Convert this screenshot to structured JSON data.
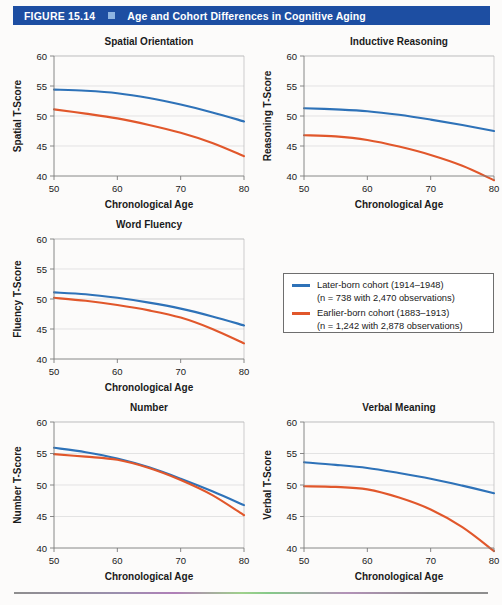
{
  "header": {
    "figure_number": "FIGURE 15.14",
    "separator_icon": "square-marker-icon",
    "title": "Age and Cohort Differences in Cognitive Aging",
    "bar_color": "#1d4ea2",
    "separator_color": "#8db4e2"
  },
  "colors": {
    "later_born": "#2e72b8",
    "earlier_born": "#e1572b",
    "grid": "#d8d8d8",
    "axis": "#7a7a7a"
  },
  "legend": {
    "position": "middle-right",
    "entries": [
      {
        "swatch": "line-swatch-blue",
        "color": "#2e72b8",
        "line1": "Later-born cohort (1914–1948)",
        "line2": "(n = 738 with 2,470 observations)"
      },
      {
        "swatch": "line-swatch-orange",
        "color": "#e1572b",
        "line1": "Earlier-born cohort (1883–1913)",
        "line2": "(n = 1,242 with 2,878 observations)"
      }
    ]
  },
  "chart_data": [
    {
      "id": "spatial-orientation",
      "type": "line",
      "title": "Spatial Orientation",
      "xlabel": "Chronological Age",
      "ylabel": "Spatial T-Score",
      "xlim": [
        50,
        80
      ],
      "ylim": [
        40,
        60
      ],
      "xticks": [
        50,
        60,
        70,
        80
      ],
      "yticks": [
        40,
        45,
        50,
        55,
        60
      ],
      "grid": true,
      "x": [
        50,
        55,
        60,
        65,
        70,
        75,
        80
      ],
      "series": [
        {
          "name": "Later-born cohort (1914–1948)",
          "color": "#2e72b8",
          "values": [
            54.4,
            54.2,
            53.8,
            53.0,
            51.9,
            50.6,
            49.1
          ]
        },
        {
          "name": "Earlier-born cohort (1883–1913)",
          "color": "#e1572b",
          "values": [
            51.1,
            50.4,
            49.6,
            48.5,
            47.2,
            45.5,
            43.3
          ]
        }
      ]
    },
    {
      "id": "inductive-reasoning",
      "type": "line",
      "title": "Inductive Reasoning",
      "xlabel": "Chronological Age",
      "ylabel": "Reasoning T-Score",
      "xlim": [
        50,
        80
      ],
      "ylim": [
        40,
        60
      ],
      "xticks": [
        50,
        60,
        70,
        80
      ],
      "yticks": [
        40,
        45,
        50,
        55,
        60
      ],
      "grid": true,
      "x": [
        50,
        55,
        60,
        65,
        70,
        75,
        80
      ],
      "series": [
        {
          "name": "Later-born cohort (1914–1948)",
          "color": "#2e72b8",
          "values": [
            51.3,
            51.1,
            50.8,
            50.2,
            49.4,
            48.5,
            47.5
          ]
        },
        {
          "name": "Earlier-born cohort (1883–1913)",
          "color": "#e1572b",
          "values": [
            46.8,
            46.6,
            46.0,
            44.9,
            43.5,
            41.7,
            39.3
          ]
        }
      ]
    },
    {
      "id": "word-fluency",
      "type": "line",
      "title": "Word Fluency",
      "xlabel": "Chronological Age",
      "ylabel": "Fluency T-Score",
      "xlim": [
        50,
        80
      ],
      "ylim": [
        40,
        60
      ],
      "xticks": [
        50,
        60,
        70,
        80
      ],
      "yticks": [
        40,
        45,
        50,
        55,
        60
      ],
      "grid": true,
      "x": [
        50,
        55,
        60,
        65,
        70,
        75,
        80
      ],
      "series": [
        {
          "name": "Later-born cohort (1914–1948)",
          "color": "#2e72b8",
          "values": [
            51.1,
            50.8,
            50.2,
            49.4,
            48.4,
            47.1,
            45.6
          ]
        },
        {
          "name": "Earlier-born cohort (1883–1913)",
          "color": "#e1572b",
          "values": [
            50.2,
            49.7,
            49.0,
            48.1,
            46.9,
            45.0,
            42.6
          ]
        }
      ]
    },
    {
      "id": "number",
      "type": "line",
      "title": "Number",
      "xlabel": "Chronological Age",
      "ylabel": "Number T-Score",
      "xlim": [
        50,
        80
      ],
      "ylim": [
        40,
        60
      ],
      "xticks": [
        50,
        60,
        70,
        80
      ],
      "yticks": [
        40,
        45,
        50,
        55,
        60
      ],
      "grid": true,
      "x": [
        50,
        55,
        60,
        65,
        70,
        75,
        80
      ],
      "series": [
        {
          "name": "Later-born cohort (1914–1948)",
          "color": "#2e72b8",
          "values": [
            55.9,
            55.2,
            54.2,
            52.8,
            51.0,
            49.0,
            46.8
          ]
        },
        {
          "name": "Earlier-born cohort (1883–1913)",
          "color": "#e1572b",
          "values": [
            54.9,
            54.5,
            54.0,
            52.7,
            50.8,
            48.4,
            45.2
          ]
        }
      ]
    },
    {
      "id": "verbal-meaning",
      "type": "line",
      "title": "Verbal Meaning",
      "xlabel": "Chronological Age",
      "ylabel": "Verbal T-Score",
      "xlim": [
        50,
        80
      ],
      "ylim": [
        40,
        60
      ],
      "xticks": [
        50,
        60,
        70,
        80
      ],
      "yticks": [
        40,
        45,
        50,
        55,
        60
      ],
      "grid": true,
      "x": [
        50,
        55,
        60,
        65,
        70,
        75,
        80
      ],
      "series": [
        {
          "name": "Later-born cohort (1914–1948)",
          "color": "#2e72b8",
          "values": [
            53.6,
            53.2,
            52.7,
            51.9,
            51.0,
            49.9,
            48.7
          ]
        },
        {
          "name": "Earlier-born cohort (1883–1913)",
          "color": "#e1572b",
          "values": [
            49.8,
            49.7,
            49.3,
            48.0,
            46.1,
            43.3,
            39.5
          ]
        }
      ]
    }
  ],
  "panel_layout": [
    {
      "id": "spatial-orientation",
      "left": 8,
      "top": 30,
      "width": 244,
      "height": 190
    },
    {
      "id": "inductive-reasoning",
      "left": 258,
      "top": 30,
      "width": 244,
      "height": 190
    },
    {
      "id": "word-fluency",
      "left": 8,
      "top": 213,
      "width": 244,
      "height": 190
    },
    {
      "id": "number",
      "left": 8,
      "top": 396,
      "width": 244,
      "height": 196
    },
    {
      "id": "verbal-meaning",
      "left": 258,
      "top": 396,
      "width": 244,
      "height": 196
    }
  ]
}
